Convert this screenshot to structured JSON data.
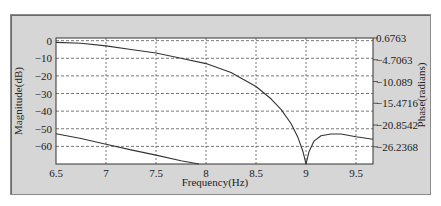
{
  "chart_data": {
    "type": "line",
    "title": "",
    "xlabel": "Frequency(Hz)",
    "ylabel": "Magnitude(dB)",
    "ylabel_right": "Phase(radians)",
    "xlim": [
      6.5,
      9.67
    ],
    "ylim": [
      -70,
      1.5
    ],
    "ylim_right": [
      -30.5,
      0.6763
    ],
    "grid": true,
    "legend": null,
    "x_ticks": [
      "6.5",
      "7",
      "7.5",
      "8",
      "8.5",
      "9",
      "9.5"
    ],
    "y_ticks_left": [
      "0",
      "-10",
      "-20",
      "-30",
      "-40",
      "-50",
      "-60"
    ],
    "y_ticks_right": [
      "0.6763",
      "-4.7063",
      "-10.089",
      "-15.4716",
      "-20.8542",
      "-26.2368"
    ],
    "series": [
      {
        "name": "Magnitude",
        "axis": "left",
        "x": [
          6.5,
          6.75,
          7.0,
          7.25,
          7.5,
          7.75,
          8.0,
          8.25,
          8.5,
          8.65,
          8.75,
          8.85,
          8.92,
          8.97,
          9.0,
          9.03,
          9.08,
          9.15,
          9.25,
          9.35,
          9.5,
          9.67
        ],
        "values": [
          -1,
          -1.5,
          -3,
          -5,
          -7,
          -10,
          -13,
          -18,
          -26,
          -33,
          -39,
          -47,
          -55,
          -63,
          -70,
          -63,
          -57,
          -54,
          -53,
          -53,
          -54.5,
          -56
        ]
      },
      {
        "name": "Phase",
        "axis": "right",
        "x": [
          6.5,
          6.75,
          7.0,
          7.25,
          7.5,
          7.75,
          7.93
        ],
        "values": [
          -23.0,
          -24.2,
          -25.6,
          -27.0,
          -28.3,
          -29.7,
          -30.5
        ]
      }
    ]
  },
  "colors": {
    "panel": "#d6d6d6",
    "plot_bg": "#ffffff",
    "line": "#333333",
    "grid": "#555555"
  }
}
